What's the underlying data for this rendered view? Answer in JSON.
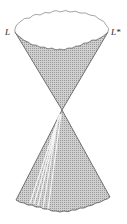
{
  "figure": {
    "type": "light-cone diagram",
    "labels": {
      "left_rim": "L",
      "right_rim": "L*"
    },
    "colors": {
      "cone_fill": "#bdbdbd",
      "outline": "#555555",
      "rim_interior": "#ffffff",
      "highlight": "#f2f2f2"
    }
  }
}
